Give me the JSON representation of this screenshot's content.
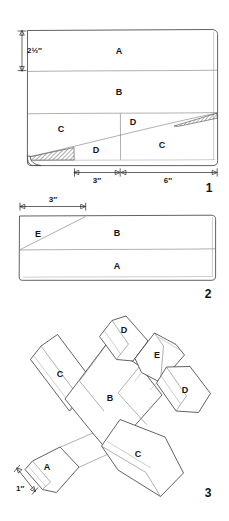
{
  "document": {
    "type": "technical-assembly-diagram",
    "subject": "toy airplane cut-and-assemble pattern",
    "ink_color": "#3a3a3a",
    "paper_color": "#ffffff"
  },
  "figures": [
    {
      "number": "1",
      "name": "layout-plan-view",
      "caption_number": "1",
      "part_labels": [
        "A",
        "B",
        "C",
        "D",
        "D",
        "C"
      ],
      "dimensions": [
        {
          "name": "height-top-band",
          "value": "2½″",
          "orientation": "vertical"
        },
        {
          "name": "segment-left",
          "value": "3″",
          "orientation": "horizontal"
        },
        {
          "name": "segment-right",
          "value": "6″",
          "orientation": "horizontal"
        }
      ],
      "shaded_wedges": 2
    },
    {
      "number": "2",
      "name": "side-elevation-view",
      "caption_number": "2",
      "part_labels": [
        "E",
        "B",
        "A"
      ],
      "dimensions": [
        {
          "name": "taper-length",
          "value": "3″",
          "orientation": "horizontal"
        }
      ]
    },
    {
      "number": "3",
      "name": "assembled-isometric-view",
      "caption_number": "3",
      "part_labels": [
        "D",
        "E",
        "D",
        "C",
        "B",
        "C",
        "A"
      ],
      "dimensions": [
        {
          "name": "nose-thickness",
          "value": "1″",
          "orientation": "diagonal"
        }
      ]
    }
  ],
  "fig1": {
    "label_A": "A",
    "label_B": "B",
    "label_C_left": "C",
    "label_D_lower": "D",
    "label_D_upper": "D",
    "label_C_right": "C",
    "dim_height": "2½″",
    "dim_left": "3″",
    "dim_right": "6″",
    "number": "1"
  },
  "fig2": {
    "label_E": "E",
    "label_B": "B",
    "label_A": "A",
    "dim_top": "3″",
    "number": "2"
  },
  "fig3": {
    "label_D_top": "D",
    "label_E": "E",
    "label_D_right": "D",
    "label_C_upper": "C",
    "label_B": "B",
    "label_C_lower": "C",
    "label_A": "A",
    "dim_nose": "1″",
    "number": "3"
  }
}
